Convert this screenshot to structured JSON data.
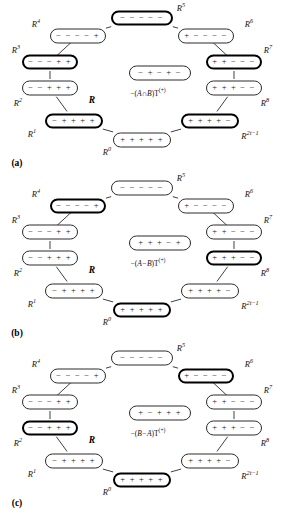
{
  "figure": {
    "ring_label": "R",
    "node_sequences": {
      "R0": "+ + + + +",
      "R1": "− + + + +",
      "R2": "− − + + +",
      "R3": "− − − + +",
      "R4": "− − − − +",
      "R5": "− − − − −",
      "R6": "+ − − − −",
      "R7": "+ + − − −",
      "R8": "+ + + − −",
      "R2t1": "+ + + + −"
    },
    "node_labels": {
      "R0": "R",
      "R0_sup": "0",
      "R1": "R",
      "R1_sup": "1",
      "R2": "R",
      "R2_sup": "2",
      "R3": "R",
      "R3_sup": "3",
      "R4": "R",
      "R4_sup": "4",
      "R5": "R",
      "R5_sup": "5",
      "R6": "R",
      "R6_sup": "6",
      "R7": "R",
      "R7_sup": "7",
      "R8": "R",
      "R8_sup": "8",
      "R2t1": "R",
      "R2t1_sup": "2t−1"
    }
  },
  "panels": [
    {
      "id": "a",
      "caption": "(a)",
      "center_node": "− + − + −",
      "formula_prefix": "−(",
      "formula_set": "A∩B",
      "formula_suffix": ")",
      "formula_op": "T",
      "formula_sup": "(+)",
      "bold_nodes": [
        "R1",
        "R3",
        "R5",
        "R7",
        "R2t1"
      ],
      "center_bold": true
    },
    {
      "id": "b",
      "caption": "(b)",
      "center_node": "+ + + − +",
      "formula_prefix": "−(",
      "formula_set": "A−B",
      "formula_suffix": ")",
      "formula_op": "T",
      "formula_sup": "(+)",
      "bold_nodes": [
        "R0",
        "R4",
        "R8"
      ],
      "center_bold": true
    },
    {
      "id": "c",
      "caption": "(c)",
      "center_node": "+ − + + +",
      "formula_prefix": "−(",
      "formula_set": "B−A",
      "formula_suffix": ")",
      "formula_op": "T",
      "formula_sup": "(+)",
      "bold_nodes": [
        "R0",
        "R2",
        "R6"
      ],
      "center_bold": true
    }
  ],
  "colors": {
    "stroke": "#2b2b2b",
    "bold_stroke": "#000000",
    "background": "#ffffff",
    "text": "#111111"
  }
}
